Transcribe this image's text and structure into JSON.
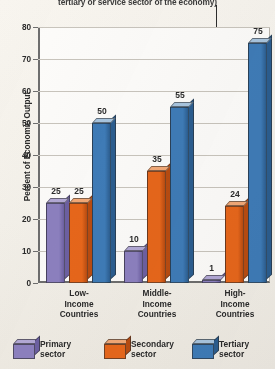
{
  "caption": {
    "text": "tertiary or service sector of the economy)"
  },
  "chart_data": {
    "type": "bar",
    "title": "",
    "subtitle": "",
    "xlabel": "",
    "ylabel": "Percent of Economic Output",
    "ylim": [
      0,
      80
    ],
    "yticks": [
      0,
      10,
      20,
      30,
      40,
      50,
      60,
      70,
      80
    ],
    "ytick_labels": [
      "0",
      "10",
      "20",
      "30",
      "40",
      "50",
      "60",
      "70",
      "80"
    ],
    "grid": true,
    "legend_position": "bottom",
    "categories": [
      "Low-Income Countries",
      "Middle-Income Countries",
      "High-Income Countries"
    ],
    "category_lines": [
      [
        "Low-",
        "Income",
        "Countries"
      ],
      [
        "Middle-",
        "Income",
        "Countries"
      ],
      [
        "High-",
        "Income",
        "Countries"
      ]
    ],
    "series": [
      {
        "name": "Primary sector",
        "legend_lines": [
          "Primary",
          "sector"
        ],
        "color": "#8d81c0",
        "top_color": "#b3a9d6",
        "side_color": "#6d60a2",
        "values": [
          25,
          10,
          1
        ]
      },
      {
        "name": "Secondary sector",
        "legend_lines": [
          "Secondary",
          "sector"
        ],
        "color": "#e8671b",
        "top_color": "#f3a977",
        "side_color": "#b94c11",
        "values": [
          25,
          35,
          24
        ]
      },
      {
        "name": "Tertiary sector",
        "legend_lines": [
          "Tertiary",
          "sector"
        ],
        "color": "#3f7cb8",
        "top_color": "#a9c6e0",
        "side_color": "#2c5e90",
        "values": [
          50,
          55,
          75
        ]
      }
    ],
    "value_labels": [
      [
        "25",
        "25",
        "50"
      ],
      [
        "10",
        "35",
        "55"
      ],
      [
        "1",
        "24",
        "75"
      ]
    ]
  },
  "colors": {
    "background": "#f7f4ee",
    "plot_background": "#fdfcfa",
    "axis": "#6e6e6e",
    "grid": "#c9c5bd",
    "text": "#2b2b2b"
  }
}
